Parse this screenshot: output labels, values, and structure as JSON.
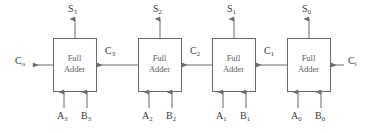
{
  "diagram": {
    "type": "block-diagram",
    "stroke_color": "#6b6b6b",
    "text_color": "#3a3a3a",
    "box_label_color": "#5a5a5a",
    "background": "#ffffff",
    "block_label_line1": "Full",
    "block_label_line2": "Adder",
    "blocks": [
      {
        "id": "fa3",
        "label": "Full\nAdder",
        "bit": "3",
        "x": 53,
        "y": 38,
        "w": 43,
        "h": 53,
        "sum_out": "S",
        "sum_sub": "3",
        "carry_out": "C",
        "carry_out_sub": "o",
        "carry_in": "C",
        "carry_in_sub": "3",
        "input_a": "A",
        "input_a_sub": "3",
        "input_b": "B",
        "input_b_sub": "3"
      },
      {
        "id": "fa2",
        "label": "Full\nAdder",
        "bit": "2",
        "x": 138,
        "y": 38,
        "w": 43,
        "h": 53,
        "sum_out": "S",
        "sum_sub": "2",
        "carry_out": "C",
        "carry_out_sub": "3",
        "carry_in": "C",
        "carry_in_sub": "2",
        "input_a": "A",
        "input_a_sub": "2",
        "input_b": "B",
        "input_b_sub": "2"
      },
      {
        "id": "fa1",
        "label": "Full\nAdder",
        "bit": "1",
        "x": 212,
        "y": 38,
        "w": 43,
        "h": 53,
        "sum_out": "S",
        "sum_sub": "1",
        "carry_out": "C",
        "carry_out_sub": "2",
        "carry_in": "C",
        "carry_in_sub": "1",
        "input_a": "A",
        "input_a_sub": "1",
        "input_b": "B",
        "input_b_sub": "1"
      },
      {
        "id": "fa0",
        "label": "Full\nAdder",
        "bit": "0",
        "x": 287,
        "y": 38,
        "w": 43,
        "h": 53,
        "sum_out": "S",
        "sum_sub": "0",
        "carry_out": "C",
        "carry_out_sub": "1",
        "carry_in": "C",
        "carry_in_sub": "i",
        "input_a": "A",
        "input_a_sub": "0",
        "input_b": "B",
        "input_b_sub": "0"
      }
    ],
    "labels": {
      "sum_outputs": [
        {
          "name": "S3",
          "base": "S",
          "sub": "3",
          "x": 68,
          "y": 4
        },
        {
          "name": "S2",
          "base": "S",
          "sub": "2",
          "x": 153,
          "y": 4
        },
        {
          "name": "S1",
          "base": "S",
          "sub": "1",
          "x": 227,
          "y": 4
        },
        {
          "name": "S0",
          "base": "S",
          "sub": "0",
          "x": 302,
          "y": 4
        }
      ],
      "carry_labels": [
        {
          "name": "Co",
          "base": "C",
          "sub": "o",
          "x": 17,
          "y": 56
        },
        {
          "name": "C3",
          "base": "C",
          "sub": "3",
          "x": 105,
          "y": 45
        },
        {
          "name": "C2",
          "base": "C",
          "sub": "2",
          "x": 180,
          "y": 45
        },
        {
          "name": "C1",
          "base": "C",
          "sub": "1",
          "x": 255,
          "y": 45
        },
        {
          "name": "Ci",
          "base": "C",
          "sub": "i",
          "x": 348,
          "y": 56
        }
      ],
      "operand_inputs": [
        {
          "name": "A3",
          "base": "A",
          "sub": "3",
          "x": 57,
          "y": 112
        },
        {
          "name": "B3",
          "base": "B",
          "sub": "3",
          "x": 81,
          "y": 112
        },
        {
          "name": "A2",
          "base": "A",
          "sub": "2",
          "x": 142,
          "y": 112
        },
        {
          "name": "B2",
          "base": "B",
          "sub": "2",
          "x": 166,
          "y": 112
        },
        {
          "name": "A1",
          "base": "A",
          "sub": "1",
          "x": 216,
          "y": 112
        },
        {
          "name": "B1",
          "base": "B",
          "sub": "1",
          "x": 240,
          "y": 112
        },
        {
          "name": "A0",
          "base": "A",
          "sub": "0",
          "x": 291,
          "y": 112
        },
        {
          "name": "B0",
          "base": "B",
          "sub": "0",
          "x": 315,
          "y": 112
        }
      ]
    }
  }
}
